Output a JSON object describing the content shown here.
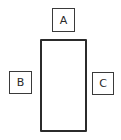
{
  "diagram": {
    "main_rectangle": {
      "label": ""
    },
    "boxes": [
      {
        "id": "A",
        "label": "A",
        "position": "top"
      },
      {
        "id": "B",
        "label": "B",
        "position": "left"
      },
      {
        "id": "C",
        "label": "C",
        "position": "right"
      }
    ],
    "colors": {
      "stroke": "#2b2b2b",
      "background": "#ffffff",
      "text": "#2a2a2a"
    }
  }
}
